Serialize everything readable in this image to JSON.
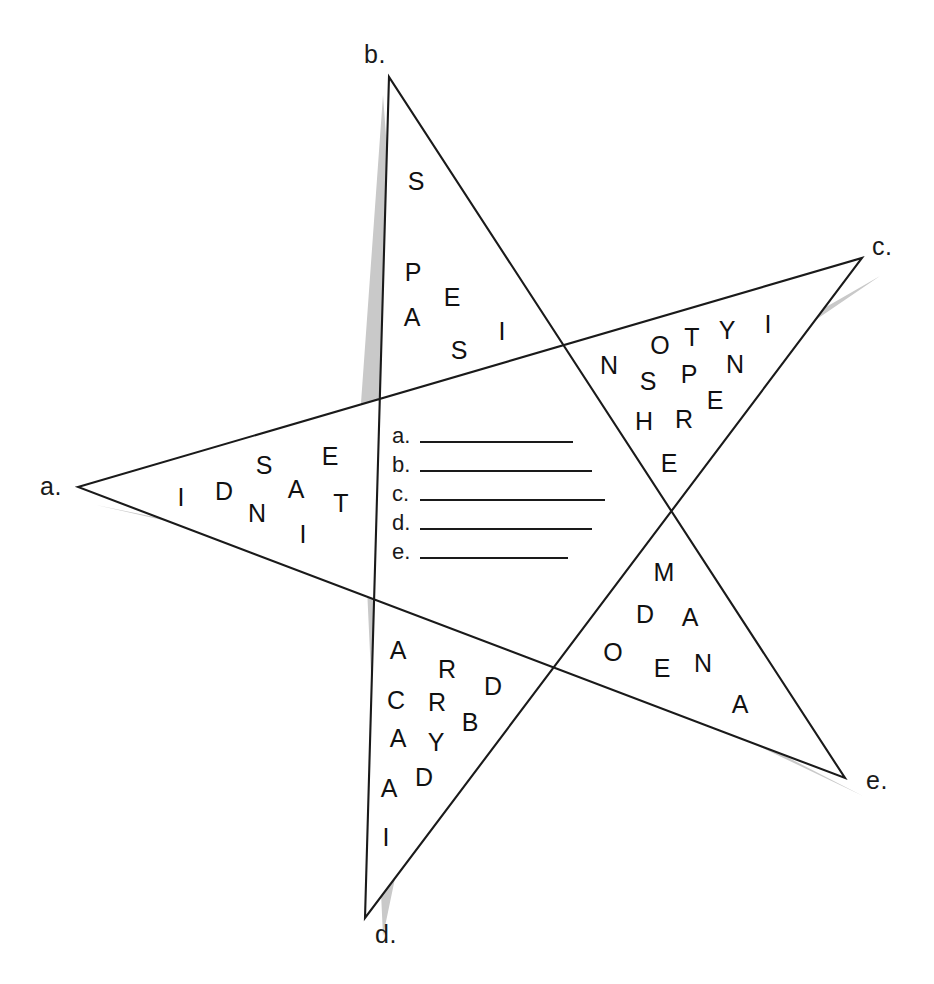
{
  "worksheet": {
    "type": "word-scramble-star-puzzle",
    "background_color": "#ffffff",
    "line_color": "#1a1a1a",
    "shadow_color": "#c9c9c9"
  },
  "star": {
    "outer_points": [
      {
        "key": "a",
        "label": "a.",
        "x": 78,
        "y": 487
      },
      {
        "key": "b",
        "label": "b.",
        "x": 389,
        "y": 77
      },
      {
        "key": "c",
        "label": "c.",
        "x": 862,
        "y": 258
      },
      {
        "key": "d",
        "label": "d.",
        "x": 365,
        "y": 918
      },
      {
        "key": "e",
        "label": "e.",
        "x": 845,
        "y": 778
      }
    ],
    "vertex_labels": [
      {
        "name": "point-label-a",
        "text": "a.",
        "left": 40,
        "top": 472
      },
      {
        "name": "point-label-b",
        "text": "b.",
        "left": 364,
        "top": 40
      },
      {
        "name": "point-label-c",
        "text": "c.",
        "left": 872,
        "top": 232
      },
      {
        "name": "point-label-d",
        "text": "d.",
        "left": 375,
        "top": 920
      },
      {
        "name": "point-label-e",
        "text": "e.",
        "left": 866,
        "top": 766
      }
    ]
  },
  "points": {
    "b_top": {
      "label": "b.",
      "letters": [
        "S",
        "P",
        "E",
        "A",
        "S",
        "I",
        "S"
      ],
      "placed": [
        {
          "ch": "S",
          "x": 416,
          "y": 181
        },
        {
          "ch": "P",
          "x": 413,
          "y": 272
        },
        {
          "ch": "E",
          "x": 452,
          "y": 297
        },
        {
          "ch": "A",
          "x": 412,
          "y": 317
        },
        {
          "ch": "S",
          "x": 459,
          "y": 350
        },
        {
          "ch": "I",
          "x": 502,
          "y": 331
        }
      ]
    },
    "c_right": {
      "label": "c.",
      "letters": [
        "N",
        "O",
        "T",
        "Y",
        "I",
        "S",
        "P",
        "N",
        "H",
        "R",
        "E",
        "E"
      ],
      "placed": [
        {
          "ch": "N",
          "x": 609,
          "y": 365
        },
        {
          "ch": "O",
          "x": 660,
          "y": 345
        },
        {
          "ch": "T",
          "x": 692,
          "y": 337
        },
        {
          "ch": "Y",
          "x": 727,
          "y": 330
        },
        {
          "ch": "I",
          "x": 768,
          "y": 324
        },
        {
          "ch": "S",
          "x": 648,
          "y": 381
        },
        {
          "ch": "P",
          "x": 689,
          "y": 374
        },
        {
          "ch": "N",
          "x": 735,
          "y": 364
        },
        {
          "ch": "E",
          "x": 715,
          "y": 400
        },
        {
          "ch": "H",
          "x": 644,
          "y": 421
        },
        {
          "ch": "R",
          "x": 684,
          "y": 419
        },
        {
          "ch": "E",
          "x": 669,
          "y": 463
        }
      ]
    },
    "a_left": {
      "label": "a.",
      "letters": [
        "I",
        "D",
        "S",
        "A",
        "E",
        "N",
        "T",
        "I"
      ],
      "placed": [
        {
          "ch": "I",
          "x": 181,
          "y": 497
        },
        {
          "ch": "D",
          "x": 224,
          "y": 491
        },
        {
          "ch": "S",
          "x": 264,
          "y": 465
        },
        {
          "ch": "A",
          "x": 296,
          "y": 489
        },
        {
          "ch": "E",
          "x": 330,
          "y": 456
        },
        {
          "ch": "N",
          "x": 257,
          "y": 513
        },
        {
          "ch": "T",
          "x": 341,
          "y": 503
        },
        {
          "ch": "I",
          "x": 303,
          "y": 534
        }
      ]
    },
    "d_bottom": {
      "label": "d.",
      "letters": [
        "A",
        "R",
        "D",
        "C",
        "R",
        "B",
        "A",
        "Y",
        "D",
        "A",
        "I"
      ],
      "placed": [
        {
          "ch": "A",
          "x": 398,
          "y": 650
        },
        {
          "ch": "R",
          "x": 447,
          "y": 669
        },
        {
          "ch": "D",
          "x": 493,
          "y": 686
        },
        {
          "ch": "C",
          "x": 396,
          "y": 700
        },
        {
          "ch": "R",
          "x": 437,
          "y": 702
        },
        {
          "ch": "B",
          "x": 470,
          "y": 722
        },
        {
          "ch": "A",
          "x": 398,
          "y": 738
        },
        {
          "ch": "Y",
          "x": 436,
          "y": 742
        },
        {
          "ch": "D",
          "x": 424,
          "y": 777
        },
        {
          "ch": "A",
          "x": 389,
          "y": 788
        },
        {
          "ch": "I",
          "x": 386,
          "y": 837
        }
      ]
    },
    "e_lower_right": {
      "label": "e.",
      "letters": [
        "M",
        "D",
        "A",
        "O",
        "E",
        "N",
        "A"
      ],
      "placed": [
        {
          "ch": "M",
          "x": 664,
          "y": 572
        },
        {
          "ch": "D",
          "x": 645,
          "y": 614
        },
        {
          "ch": "A",
          "x": 690,
          "y": 617
        },
        {
          "ch": "O",
          "x": 613,
          "y": 652
        },
        {
          "ch": "E",
          "x": 662,
          "y": 668
        },
        {
          "ch": "N",
          "x": 703,
          "y": 663
        },
        {
          "ch": "A",
          "x": 740,
          "y": 704
        }
      ]
    }
  },
  "answers": {
    "rows": [
      {
        "label": "a.",
        "value": "",
        "line_width": 153
      },
      {
        "label": "b.",
        "value": "",
        "line_width": 172
      },
      {
        "label": "c.",
        "value": "",
        "line_width": 185
      },
      {
        "label": "d.",
        "value": "",
        "line_width": 172
      },
      {
        "label": "e.",
        "value": "",
        "line_width": 148
      }
    ]
  }
}
